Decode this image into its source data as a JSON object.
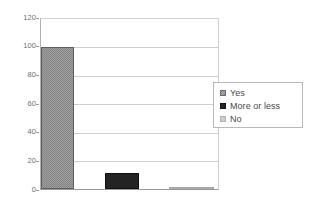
{
  "chart_data": {
    "type": "bar",
    "title": "",
    "subtitle": "",
    "xlabel": "",
    "ylabel": "",
    "categories": [
      "Yes",
      "More or less",
      "No"
    ],
    "values": [
      100,
      11,
      1
    ],
    "series": [
      {
        "name": "Responses",
        "values": [
          100,
          11,
          1
        ]
      }
    ],
    "ylim": [
      0,
      120
    ],
    "ytick_labels": [
      "0",
      "20",
      "40",
      "60",
      "80",
      "100",
      "120"
    ],
    "ytick_values": [
      0,
      20,
      40,
      60,
      80,
      100,
      120
    ],
    "xtick_labels": [],
    "grid": "horizontal",
    "legend_position": "right",
    "legend_entries": [
      {
        "label": "Yes",
        "color": "#848484"
      },
      {
        "label": "More or less",
        "color": "#232323"
      },
      {
        "label": "No",
        "color": "#c9c9c9"
      }
    ],
    "annotations": []
  },
  "axis": {
    "y_labels": [
      "120",
      "100",
      "80",
      "60",
      "40",
      "20",
      "0"
    ]
  },
  "legend": {
    "items": [
      {
        "label": "Yes"
      },
      {
        "label": "More or less"
      },
      {
        "label": "No"
      }
    ]
  },
  "colors": {
    "bar_yes": "#848484",
    "bar_more_or_less": "#232323",
    "bar_no": "#c9c9c9",
    "gridline": "#cfcfcf",
    "axis": "#9a9a9a",
    "text": "#4a4a4a",
    "tick_text": "#6e6e6e",
    "background": "#ffffff"
  }
}
